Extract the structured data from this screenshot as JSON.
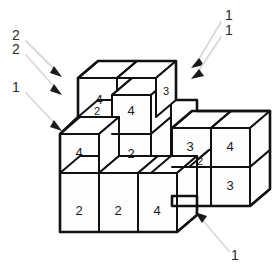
{
  "figure": {
    "background_color": "#ffffff",
    "line_color": "#111111",
    "leader_color": "#d9d9d9",
    "arrowhead_color": "#1a1a1a"
  },
  "cube_faces": [
    {
      "id": "back-left-upper-front",
      "label": "4",
      "x": 99,
      "y": 101
    },
    {
      "id": "back-mid-upper-front",
      "label": "4",
      "x": 131,
      "y": 112
    },
    {
      "id": "back-right-upper-side",
      "label": "3",
      "x": 170,
      "y": 92
    },
    {
      "id": "mid-left-step-top",
      "label": "2",
      "x": 98,
      "y": 128
    },
    {
      "id": "center-lower-front",
      "label": "2",
      "x": 131,
      "y": 156
    },
    {
      "id": "left-mid-front",
      "label": "4",
      "x": 80,
      "y": 170
    },
    {
      "id": "right-block-top-left-front",
      "label": "3",
      "x": 189,
      "y": 144
    },
    {
      "id": "right-block-top-right-front",
      "label": "4",
      "x": 228,
      "y": 143
    },
    {
      "id": "right-block-step-top",
      "label": "2",
      "x": 204,
      "y": 171
    },
    {
      "id": "right-block-lower-right-front",
      "label": "3",
      "x": 228,
      "y": 183
    },
    {
      "id": "front-row-left",
      "label": "2",
      "x": 79,
      "y": 212
    },
    {
      "id": "front-row-middle",
      "label": "2",
      "x": 116,
      "y": 212
    },
    {
      "id": "front-row-right",
      "label": "4",
      "x": 155,
      "y": 212
    }
  ],
  "callouts": [
    {
      "id": "callout-left-top",
      "label": "2",
      "label_x": 16,
      "label_y": 36,
      "line": {
        "x1": 26,
        "y1": 41,
        "x2": 57,
        "y2": 72
      },
      "arrow_x": 60,
      "arrow_y": 75,
      "arrow_dir": "down-right"
    },
    {
      "id": "callout-left-second",
      "label": "2",
      "label_x": 16,
      "label_y": 50,
      "line": {
        "x1": 26,
        "y1": 55,
        "x2": 57,
        "y2": 90
      },
      "arrow_x": 60,
      "arrow_y": 93,
      "arrow_dir": "down-right"
    },
    {
      "id": "callout-left-bottom",
      "label": "1",
      "label_x": 16,
      "label_y": 88,
      "line": {
        "x1": 26,
        "y1": 93,
        "x2": 57,
        "y2": 126
      },
      "arrow_x": 60,
      "arrow_y": 129,
      "arrow_dir": "down-right"
    },
    {
      "id": "callout-right-top",
      "label": "1",
      "label_x": 229,
      "label_y": 16,
      "line": {
        "x1": 222,
        "y1": 21,
        "x2": 196,
        "y2": 63
      },
      "arrow_x": 193,
      "arrow_y": 67,
      "arrow_dir": "up-left"
    },
    {
      "id": "callout-right-second",
      "label": "1",
      "label_x": 229,
      "label_y": 31,
      "line": {
        "x1": 222,
        "y1": 36,
        "x2": 196,
        "y2": 74
      },
      "arrow_x": 193,
      "arrow_y": 78,
      "arrow_dir": "up-left"
    },
    {
      "id": "callout-bottom-right",
      "label": "1",
      "label_x": 234,
      "label_y": 256,
      "line": {
        "x1": 228,
        "y1": 250,
        "x2": 199,
        "y2": 216
      },
      "arrow_x": 195,
      "arrow_y": 212,
      "arrow_dir": "up-left"
    }
  ]
}
